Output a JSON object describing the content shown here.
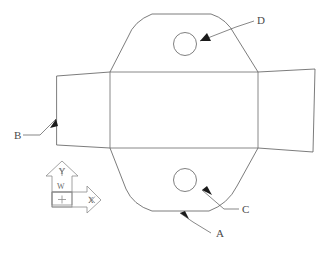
{
  "drawing": {
    "title": "Sheet Metal Flat Pattern Part Outline",
    "background_color": "#ffffff",
    "line_color": "#5a5a5a",
    "arrow_color": "#1a1a1a",
    "canvas": {
      "width": 325,
      "height": 256
    }
  },
  "callouts": [
    {
      "id": "A",
      "label": "A",
      "text_x": 216,
      "text_y": 237,
      "leader_path": "M 211 233 L 193 222 L 180 213",
      "arrow_points": "180,213 189,219 185,211",
      "target": "bottom-lobe-edge"
    },
    {
      "id": "B",
      "label": "B",
      "text_x": 14,
      "text_y": 139,
      "leader_path": "M 23 135 L 40 135 L 56 119",
      "arrow_points": "56,119 50,128 58,126",
      "target": "left-flap-edge"
    },
    {
      "id": "C",
      "label": "C",
      "text_x": 242,
      "text_y": 213,
      "leader_path": "M 239 209 L 224 209 L 202 190",
      "arrow_points": "202,190 212,195 207,186",
      "target": "bottom-hole"
    },
    {
      "id": "D",
      "label": "D",
      "text_x": 257,
      "text_y": 24,
      "leader_path": "M 254 21 L 236 27 L 200 41",
      "arrow_points": "200,41 211,41 207,33",
      "target": "top-hole"
    }
  ],
  "holes": [
    {
      "name": "top-hole",
      "cx": 185,
      "cy": 44,
      "r": 11.5
    },
    {
      "name": "bottom-hole",
      "cx": 185,
      "cy": 180,
      "r": 11.5
    }
  ],
  "geometry": {
    "part_outline_path": "M 57 76 L 110 72 L 128 37 Q 134 21 152 14 L 211 14 Q 227 19 235 35 L 258 72 L 315 69 L 313 152 L 258 148 L 237 186 Q 228 204 209 211 L 152 211 Q 133 205 126 189 L 110 148 L 57 145 Z",
    "fold_lines": [
      {
        "name": "left-fold",
        "x1": 110,
        "y1": 72,
        "x2": 110,
        "y2": 148
      },
      {
        "name": "right-fold",
        "x1": 258,
        "y1": 72,
        "x2": 258,
        "y2": 148
      },
      {
        "name": "top-fold",
        "x1": 110,
        "y1": 72,
        "x2": 258,
        "y2": 72
      },
      {
        "name": "bottom-fold",
        "x1": 110,
        "y1": 148,
        "x2": 258,
        "y2": 148
      }
    ]
  },
  "wcs_symbol": {
    "name": "world-coordinate-system",
    "origin_label": "+",
    "x_axis_label": "X",
    "y_axis_label": "Y",
    "system_label": "W",
    "box_x": 45,
    "box_y": 165,
    "arrow_color": "#8c8c8c"
  }
}
